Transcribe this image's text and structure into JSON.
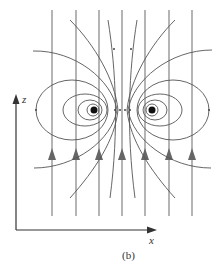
{
  "figure": {
    "caption": "(b)",
    "axes": {
      "x_label": "x",
      "z_label": "z"
    },
    "vertical_field_lines": {
      "count": 7,
      "direction": "up"
    },
    "dipole_centers": [
      "left",
      "right"
    ],
    "colors": {
      "lines": "#555555",
      "arrows": "#666666",
      "background": "#ffffff"
    }
  }
}
